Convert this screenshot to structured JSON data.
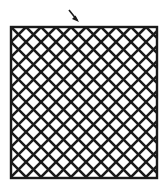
{
  "figure": {
    "canvas": {
      "width": 166,
      "height": 189,
      "background": "#ffffff"
    },
    "square": {
      "name": "outer-square",
      "x": 11,
      "y": 27,
      "width": 146,
      "height": 151,
      "stroke": "#1a1a1a",
      "stroke_width": 2.4,
      "fill": "#ffffff"
    },
    "lattice": {
      "name": "diagonal-lattice",
      "description": "45-degree crosshatch forming a diamond / rhombus net",
      "angle_degrees": 45,
      "stroke": "#1a1a1a",
      "stroke_width": 2.6,
      "contact_spacing": 15,
      "diamond_cell_width": 30,
      "diamond_cell_height": 30,
      "columns": 5,
      "rows": 5,
      "directions": [
        "down-right",
        "down-left"
      ]
    },
    "arrow": {
      "name": "pointer-arrow",
      "label": "",
      "tip_x": 79,
      "tip_y": 22,
      "tail_x": 69,
      "tail_y": 10,
      "direction": "down-right",
      "color": "#1a1a1a",
      "target": "top-edge-of-square"
    }
  }
}
